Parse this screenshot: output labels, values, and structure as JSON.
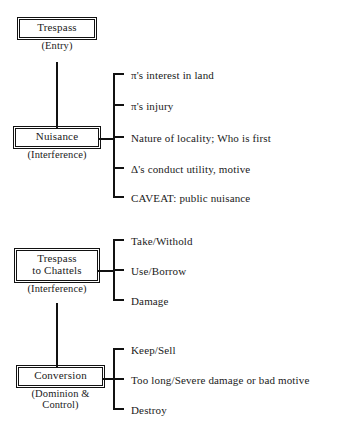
{
  "diagram": {
    "title_hidden": "Torts outline: Trespass, Nuisance, Trespass to Chattels, Conversion",
    "nodes": [
      {
        "id": "trespass",
        "label_line1": "Trespass",
        "label_line2": "",
        "sub_line1": "(Entry)",
        "sub_line2": ""
      },
      {
        "id": "nuisance",
        "label_line1": "Nuisance",
        "label_line2": "",
        "sub_line1": "(Interference)",
        "sub_line2": ""
      },
      {
        "id": "trespass-to-chattels",
        "label_line1": "Trespass",
        "label_line2": "to Chattels",
        "sub_line1": "(Interference)",
        "sub_line2": ""
      },
      {
        "id": "conversion",
        "label_line1": "Conversion",
        "label_line2": "",
        "sub_line1": "(Dominion &",
        "sub_line2": "Control)"
      }
    ],
    "branches": [
      {
        "parent": "nuisance",
        "items": [
          "π's interest in land",
          "π's injury",
          "Nature of locality; Who is first",
          "Δ's conduct utility, motive",
          "CAVEAT: public nuisance"
        ]
      },
      {
        "parent": "trespass-to-chattels",
        "items": [
          "Take/Withold",
          "Use/Borrow",
          "Damage"
        ]
      },
      {
        "parent": "conversion",
        "items": [
          "Keep/Sell",
          "Too long/Severe damage or bad motive",
          "Destroy"
        ]
      }
    ],
    "colors": {
      "ink": "#111111",
      "background": "#ffffff"
    }
  }
}
